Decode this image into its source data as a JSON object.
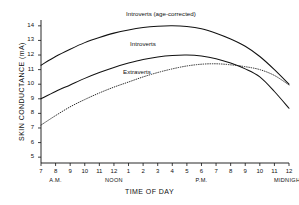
{
  "chart_data": {
    "type": "line",
    "title": "",
    "xlabel": "TIME OF DAY",
    "ylabel": "SKIN CONDUCTANCE (mA)",
    "x_tick_labels": [
      "7",
      "8",
      "9",
      "10",
      "11",
      "12",
      "1",
      "2",
      "3",
      "4",
      "5",
      "6",
      "7",
      "8",
      "9",
      "10",
      "11",
      "12"
    ],
    "x_period_labels": [
      {
        "text": "A.M.",
        "at_tick": "8"
      },
      {
        "text": "NOON",
        "at_tick": "12"
      },
      {
        "text": "P.M.",
        "at_tick": "6"
      },
      {
        "text": "MIDNIGHT",
        "at_tick": "12"
      }
    ],
    "y_tick_labels": [
      "14",
      "13",
      "12",
      "11",
      "10",
      "9",
      "8",
      "7",
      "6",
      "5"
    ],
    "ylim": [
      4.6,
      14.4
    ],
    "xlim": [
      0,
      17
    ],
    "grid": false,
    "legend": "inline-curve-labels",
    "series": [
      {
        "name": "Introverts (age-corrected)",
        "style": "solid",
        "label_text": "Introverts  (age-corrected)",
        "x": [
          0,
          1,
          2,
          3,
          4,
          5,
          6,
          7,
          8,
          9,
          10,
          11,
          12,
          13,
          14,
          15,
          16,
          17
        ],
        "values": [
          11.3,
          11.9,
          12.4,
          12.85,
          13.2,
          13.5,
          13.72,
          13.88,
          13.97,
          14.0,
          13.95,
          13.8,
          13.5,
          13.1,
          12.6,
          11.9,
          11.0,
          10.0
        ]
      },
      {
        "name": "Introverts",
        "style": "solid",
        "label_text": "Introverts",
        "x": [
          0,
          1,
          2,
          3,
          4,
          5,
          6,
          7,
          8,
          9,
          10,
          11,
          12,
          13,
          14,
          15,
          16,
          17
        ],
        "values": [
          9.0,
          9.5,
          9.95,
          10.4,
          10.8,
          11.15,
          11.45,
          11.7,
          11.87,
          11.97,
          12.0,
          11.93,
          11.75,
          11.45,
          11.05,
          10.5,
          9.5,
          8.35
        ]
      },
      {
        "name": "Extraverts",
        "style": "dotted",
        "label_text": "Extraverts",
        "x": [
          0,
          1,
          2,
          3,
          4,
          5,
          6,
          7,
          8,
          9,
          10,
          11,
          12,
          13,
          14,
          15,
          16,
          17
        ],
        "values": [
          7.2,
          7.85,
          8.45,
          8.95,
          9.4,
          9.8,
          10.15,
          10.5,
          10.8,
          11.05,
          11.25,
          11.37,
          11.4,
          11.33,
          11.2,
          11.0,
          10.6,
          9.95
        ]
      }
    ]
  },
  "curve_labels": [
    {
      "text": "Introverts  (age-corrected)"
    },
    {
      "text": "Introverts"
    },
    {
      "text": "Extraverts"
    }
  ]
}
